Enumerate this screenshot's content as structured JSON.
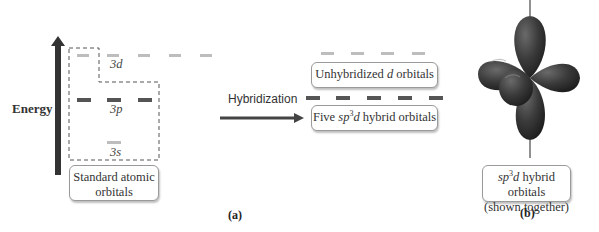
{
  "panel_a": {
    "axis_label": "Energy",
    "levels": {
      "d": {
        "label": "3d",
        "count": 5,
        "color": "#bdbdbd"
      },
      "p": {
        "label": "3p",
        "count": 3,
        "color": "#555555"
      },
      "s": {
        "label": "3s",
        "count": 1,
        "color": "#bdbdbd"
      }
    },
    "standard_box": {
      "line1": "Standard atomic",
      "line2": "orbitals"
    },
    "arrow_label": "Hybridization",
    "unhybridized_box": {
      "prefix": "Unhybridized ",
      "italic": "d",
      "suffix": " orbitals"
    },
    "hybrid_box": {
      "prefix": "Five ",
      "italic_sp": "sp",
      "sup": "3",
      "italic_d": "d",
      "suffix": " hybrid orbitals"
    },
    "unhybridized_count": 4,
    "hybrid_count": 5,
    "caption": "(a)"
  },
  "panel_b": {
    "box": {
      "italic_sp": "sp",
      "sup": "3",
      "italic_d": "d",
      "suffix": " hybrid orbitals",
      "line2": "(shown together)"
    },
    "caption": "(b)",
    "lobe_color": "#3a3a3a"
  },
  "colors": {
    "axis_arrow": "#333333",
    "dark_orbital": "#555555",
    "light_orbital": "#bdbdbd"
  }
}
